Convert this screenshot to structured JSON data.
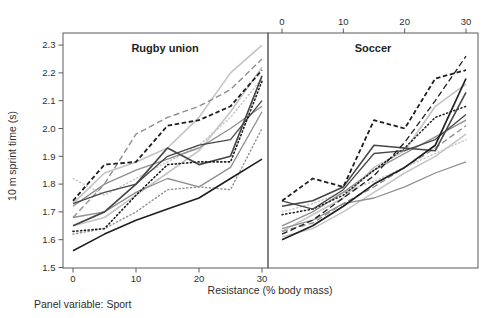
{
  "figure": {
    "footer_note": "Panel variable: Sport"
  },
  "chart_data": {
    "type": "line",
    "title": "",
    "xlabel": "Resistance (% body mass)",
    "ylabel": "10 m sprint time (s)",
    "x": [
      0,
      5,
      10,
      15,
      20,
      25,
      30
    ],
    "x_ticks": [
      0,
      10,
      20,
      30
    ],
    "y_ticks": [
      1.5,
      1.6,
      1.7,
      1.8,
      1.9,
      2.0,
      2.1,
      2.2,
      2.3
    ],
    "xlim": [
      0,
      30
    ],
    "ylim": [
      1.5,
      2.3
    ],
    "grid": false,
    "legend": "none",
    "panel_variable": "Sport",
    "panels": [
      {
        "title": "Rugby union",
        "x_axis_side": "bottom",
        "series": [
          {
            "id": "rugby-9",
            "color": "light",
            "style": "solid",
            "width": 1.6,
            "values": [
              1.73,
              1.84,
              1.88,
              1.93,
              2.04,
              2.2,
              2.3
            ]
          },
          {
            "id": "rugby-10",
            "color": "light",
            "style": "solid",
            "width": 1.6,
            "values": [
              1.65,
              1.68,
              1.76,
              1.84,
              1.92,
              2.06,
              2.22
            ]
          },
          {
            "id": "rugby-7",
            "color": "light",
            "style": "dot",
            "width": 1.4,
            "values": [
              1.82,
              1.76,
              1.82,
              1.88,
              1.94,
              2.04,
              2.18
            ]
          },
          {
            "id": "rugby-8",
            "color": "gray",
            "style": "solid",
            "width": 1.4,
            "values": [
              1.72,
              1.8,
              1.85,
              1.89,
              1.93,
              2.0,
              2.08
            ]
          },
          {
            "id": "rugby-12",
            "color": "gray",
            "style": "solid",
            "width": 1.3,
            "values": [
              1.68,
              1.7,
              1.77,
              1.82,
              1.79,
              1.86,
              2.06
            ]
          },
          {
            "id": "rugby-6",
            "color": "gray",
            "style": "dot",
            "width": 1.4,
            "values": [
              1.62,
              1.64,
              1.7,
              1.78,
              1.79,
              1.78,
              2.0
            ]
          },
          {
            "id": "rugby-11",
            "color": "gray",
            "style": "dash",
            "width": 1.4,
            "values": [
              1.68,
              1.8,
              1.98,
              2.04,
              2.08,
              2.14,
              2.25
            ]
          },
          {
            "id": "rugby-4",
            "color": "dark",
            "style": "solid",
            "width": 1.3,
            "values": [
              1.73,
              1.77,
              1.8,
              1.9,
              1.94,
              1.96,
              2.1
            ]
          },
          {
            "id": "rugby-3",
            "color": "dark",
            "style": "solid",
            "width": 1.7,
            "values": [
              1.65,
              1.7,
              1.8,
              1.93,
              1.87,
              1.9,
              2.19
            ]
          },
          {
            "id": "rugby-5",
            "color": "black",
            "style": "dot",
            "width": 1.6,
            "values": [
              1.63,
              1.64,
              1.76,
              1.87,
              1.88,
              1.88,
              2.17
            ]
          },
          {
            "id": "rugby-2",
            "color": "black",
            "style": "solid",
            "width": 1.6,
            "values": [
              1.56,
              1.62,
              1.67,
              1.71,
              1.75,
              1.82,
              1.89
            ]
          },
          {
            "id": "rugby-1",
            "color": "black",
            "style": "shortdash",
            "width": 1.8,
            "values": [
              1.74,
              1.87,
              1.88,
              2.01,
              2.03,
              2.08,
              2.21
            ]
          }
        ]
      },
      {
        "title": "Soccer",
        "x_axis_side": "top",
        "series": [
          {
            "id": "soccer-9",
            "color": "light",
            "style": "solid",
            "width": 1.6,
            "values": [
              1.63,
              1.69,
              1.75,
              1.86,
              1.92,
              2.08,
              2.16
            ]
          },
          {
            "id": "soccer-10",
            "color": "light",
            "style": "solid",
            "width": 1.5,
            "values": [
              1.61,
              1.64,
              1.7,
              1.77,
              1.84,
              1.9,
              1.98
            ]
          },
          {
            "id": "soccer-12",
            "color": "light",
            "style": "dot",
            "width": 1.4,
            "values": [
              1.7,
              1.73,
              1.77,
              1.81,
              1.86,
              1.91,
              1.96
            ]
          },
          {
            "id": "soccer-11",
            "color": "gray",
            "style": "solid",
            "width": 1.3,
            "values": [
              1.64,
              1.67,
              1.73,
              1.75,
              1.79,
              1.84,
              1.88
            ]
          },
          {
            "id": "soccer-8",
            "color": "gray",
            "style": "solid",
            "width": 1.4,
            "values": [
              1.65,
              1.7,
              1.77,
              1.85,
              1.91,
              1.97,
              2.03
            ]
          },
          {
            "id": "soccer-7",
            "color": "gray",
            "style": "dash",
            "width": 1.4,
            "values": [
              1.63,
              1.66,
              1.73,
              1.79,
              1.86,
              1.93,
              2.01
            ]
          },
          {
            "id": "soccer-6",
            "color": "black",
            "style": "dot",
            "width": 1.5,
            "values": [
              1.69,
              1.71,
              1.76,
              1.85,
              1.93,
              2.04,
              2.08
            ]
          },
          {
            "id": "soccer-5",
            "color": "dark",
            "style": "solid",
            "width": 1.3,
            "values": [
              1.74,
              1.71,
              1.78,
              1.91,
              1.92,
              1.96,
              2.05
            ]
          },
          {
            "id": "soccer-4",
            "color": "dark",
            "style": "solid",
            "width": 1.6,
            "values": [
              1.72,
              1.74,
              1.79,
              1.94,
              1.93,
              1.92,
              2.13
            ]
          },
          {
            "id": "soccer-2",
            "color": "black",
            "style": "dash",
            "width": 1.3,
            "values": [
              1.62,
              1.67,
              1.75,
              1.83,
              1.95,
              2.1,
              2.26
            ]
          },
          {
            "id": "soccer-3",
            "color": "black",
            "style": "solid",
            "width": 1.7,
            "values": [
              1.6,
              1.65,
              1.72,
              1.8,
              1.86,
              1.94,
              2.18
            ]
          },
          {
            "id": "soccer-1",
            "color": "black",
            "style": "shortdash",
            "width": 1.8,
            "values": [
              1.74,
              1.82,
              1.79,
              2.03,
              2.0,
              2.18,
              2.21
            ]
          }
        ]
      }
    ]
  },
  "styles": {
    "background": "#ffffff",
    "frame_color": "#5a5a5a",
    "tick_color": "#5a5a5a",
    "text_color": "#2e2e2e",
    "palette": {
      "black": "#1f1f1f",
      "dark": "#474747",
      "gray": "#8f8f8f",
      "light": "#c4c4c4"
    }
  }
}
